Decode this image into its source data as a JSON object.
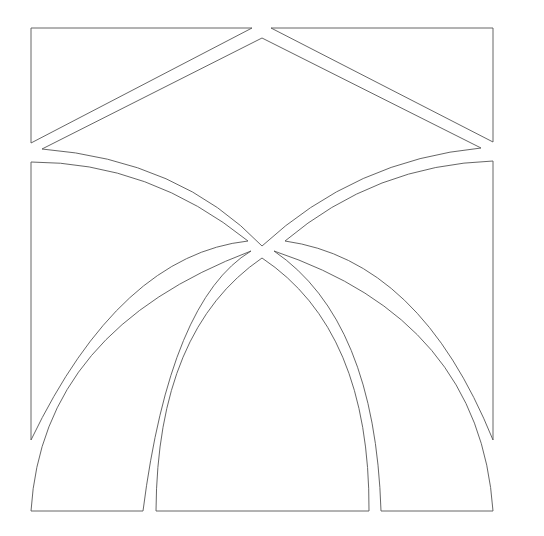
{
  "diagram": {
    "type": "stencil-pattern",
    "colors": {
      "background": "#ffffff",
      "stroke": "#555555"
    },
    "pieces": [
      {
        "name": "top-left-triangle"
      },
      {
        "name": "top-right-triangle"
      },
      {
        "name": "center-diamond"
      },
      {
        "name": "left-upper-spandrel"
      },
      {
        "name": "right-upper-spandrel"
      },
      {
        "name": "center-top-pointed-arch"
      },
      {
        "name": "bottom-left-arch-segment"
      },
      {
        "name": "bottom-center-arch"
      },
      {
        "name": "bottom-right-arch-segment"
      }
    ]
  }
}
